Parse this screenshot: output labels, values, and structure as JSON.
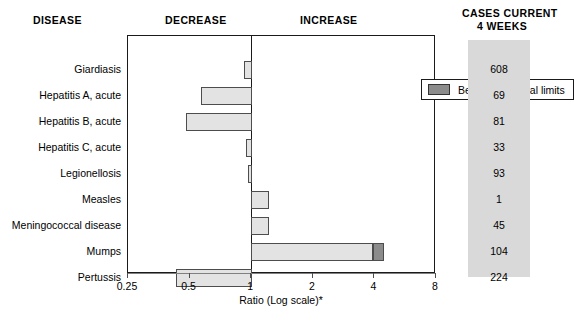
{
  "headers": {
    "disease": "DISEASE",
    "decrease": "DECREASE",
    "increase": "INCREASE",
    "cases_line1": "CASES CURRENT",
    "cases_line2": "4 WEEKS"
  },
  "legend": {
    "label": "Beyond historical limits",
    "swatch_color": "#8c8c8c"
  },
  "axis": {
    "title": "Ratio (Log scale)*",
    "ticks": [
      "0.25",
      "0.5",
      "1",
      "2",
      "4",
      "8"
    ]
  },
  "colors": {
    "bar_fill": "#e3e3e3",
    "bar_beyond_fill": "#8c8c8c",
    "bar_border": "#4d4d4d",
    "panel_bg": "#d9d9d9",
    "frame": "#1a1a1a"
  },
  "chart_data": {
    "type": "bar",
    "orientation": "horizontal",
    "title": "",
    "subtitle": "",
    "xlabel": "Ratio (Log scale)*",
    "ylabel": "DISEASE",
    "xscale": "log2",
    "xlim": [
      0.25,
      8
    ],
    "xticks": [
      0.25,
      0.5,
      1,
      2,
      4,
      8
    ],
    "xticklabels": [
      "0.25",
      "0.5",
      "1",
      "2",
      "4",
      "8"
    ],
    "reference_line": 1,
    "grid": false,
    "legend": [
      "Beyond historical limits"
    ],
    "legend_position": "top-right-inside",
    "region_labels": [
      "DECREASE",
      "INCREASE"
    ],
    "extra_column": {
      "header": "CASES CURRENT 4 WEEKS",
      "values": [
        608,
        69,
        81,
        33,
        93,
        1,
        45,
        104,
        224
      ]
    },
    "categories": [
      "Giardiasis",
      "Hepatitis A, acute",
      "Hepatitis B, acute",
      "Hepatitis C, acute",
      "Legionellosis",
      "Measles",
      "Meningococcal disease",
      "Mumps",
      "Pertussis"
    ],
    "values": [
      0.92,
      0.57,
      0.48,
      0.94,
      0.97,
      1.22,
      1.22,
      4.45,
      0.43
    ],
    "beyond_historical_limits": [
      false,
      false,
      false,
      false,
      false,
      false,
      false,
      true,
      false
    ],
    "series": [
      {
        "name": "Ratio (current 4 weeks / historical)",
        "values": [
          0.92,
          0.57,
          0.48,
          0.94,
          0.97,
          1.22,
          1.22,
          4.45,
          0.43
        ]
      }
    ],
    "rows": [
      {
        "disease": "Giardiasis",
        "ratio": 0.92,
        "cases": 608,
        "beyond": false
      },
      {
        "disease": "Hepatitis A, acute",
        "ratio": 0.57,
        "cases": 69,
        "beyond": false
      },
      {
        "disease": "Hepatitis B, acute",
        "ratio": 0.48,
        "cases": 81,
        "beyond": false
      },
      {
        "disease": "Hepatitis C, acute",
        "ratio": 0.94,
        "cases": 33,
        "beyond": false
      },
      {
        "disease": "Legionellosis",
        "ratio": 0.97,
        "cases": 93,
        "beyond": false
      },
      {
        "disease": "Measles",
        "ratio": 1.22,
        "cases": 1,
        "beyond": false
      },
      {
        "disease": "Meningococcal disease",
        "ratio": 1.22,
        "cases": 45,
        "beyond": false
      },
      {
        "disease": "Mumps",
        "ratio": 4.45,
        "cases": 104,
        "beyond": true,
        "beyond_start": 3.95
      },
      {
        "disease": "Pertussis",
        "ratio": 0.43,
        "cases": 224,
        "beyond": false
      }
    ]
  }
}
